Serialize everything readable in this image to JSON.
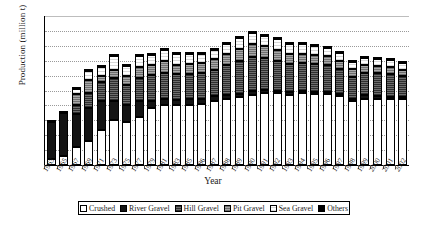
{
  "chart_data": {
    "type": "bar",
    "stacked": true,
    "title": "",
    "xlabel": "Year",
    "ylabel": "Production (million t)",
    "ylim": [
      0,
      1000
    ],
    "yticks": [
      0,
      100,
      200,
      300,
      400,
      500,
      600,
      700,
      800,
      900,
      1000
    ],
    "grid": true,
    "legend_position": "bottom",
    "legend": [
      "Crushed",
      "River Gravel",
      "Hill Gravel",
      "Pit Gravel",
      "Sea Gravel",
      "Others"
    ],
    "colors": {
      "Crushed": "#ffffff",
      "River Gravel": "#141414",
      "Hill Gravel": "#4a4a4a",
      "Pit Gravel": "#8e8e8e",
      "Sea Gravel": "#f2f2f2",
      "Others": "#000000"
    },
    "categories": [
      "1963",
      "1965",
      "1967",
      "1969",
      "1971",
      "1973",
      "1975",
      "1977",
      "1979",
      "1981",
      "1983",
      "1985",
      "1986",
      "1987",
      "1988",
      "1989",
      "1990",
      "1991",
      "1992",
      "1993",
      "1994",
      "1995",
      "1996",
      "1997",
      "1998",
      "1999",
      "2000",
      "2001",
      "2002"
    ],
    "series": [
      {
        "name": "Crushed",
        "values": [
          40,
          62,
          120,
          160,
          235,
          300,
          290,
          325,
          385,
          400,
          400,
          405,
          410,
          430,
          445,
          455,
          470,
          480,
          480,
          470,
          480,
          475,
          475,
          460,
          430,
          440,
          440,
          445,
          440
        ]
      },
      {
        "name": "River Gravel",
        "values": [
          250,
          285,
          220,
          225,
          195,
          130,
          115,
          105,
          45,
          40,
          38,
          35,
          33,
          30,
          28,
          25,
          24,
          22,
          20,
          18,
          17,
          16,
          15,
          14,
          12,
          30,
          20,
          12,
          10
        ]
      },
      {
        "name": "Hill Gravel",
        "values": [
          0,
          0,
          60,
          100,
          130,
          155,
          130,
          155,
          175,
          180,
          170,
          170,
          175,
          180,
          195,
          215,
          230,
          215,
          200,
          190,
          185,
          185,
          180,
          170,
          150,
          150,
          155,
          155,
          145
        ]
      },
      {
        "name": "Pit Gravel",
        "values": [
          0,
          0,
          75,
          85,
          40,
          50,
          60,
          75,
          65,
          75,
          65,
          65,
          65,
          70,
          75,
          85,
          90,
          80,
          75,
          70,
          65,
          65,
          60,
          55,
          50,
          50,
          48,
          45,
          42
        ]
      },
      {
        "name": "Sea Gravel",
        "values": [
          0,
          0,
          35,
          60,
          60,
          95,
          70,
          75,
          70,
          75,
          75,
          70,
          65,
          65,
          70,
          70,
          75,
          70,
          68,
          65,
          62,
          60,
          58,
          55,
          48,
          48,
          47,
          45,
          42
        ]
      },
      {
        "name": "Others",
        "values": [
          5,
          5,
          5,
          5,
          5,
          5,
          5,
          5,
          5,
          5,
          5,
          5,
          5,
          5,
          5,
          5,
          5,
          5,
          5,
          5,
          5,
          5,
          5,
          5,
          5,
          5,
          5,
          5,
          5
        ]
      }
    ],
    "totals": [
      295,
      352,
      515,
      635,
      665,
      735,
      670,
      740,
      745,
      775,
      753,
      750,
      753,
      780,
      818,
      855,
      894,
      872,
      848,
      818,
      814,
      806,
      793,
      759,
      695,
      723,
      715,
      707,
      684
    ]
  }
}
